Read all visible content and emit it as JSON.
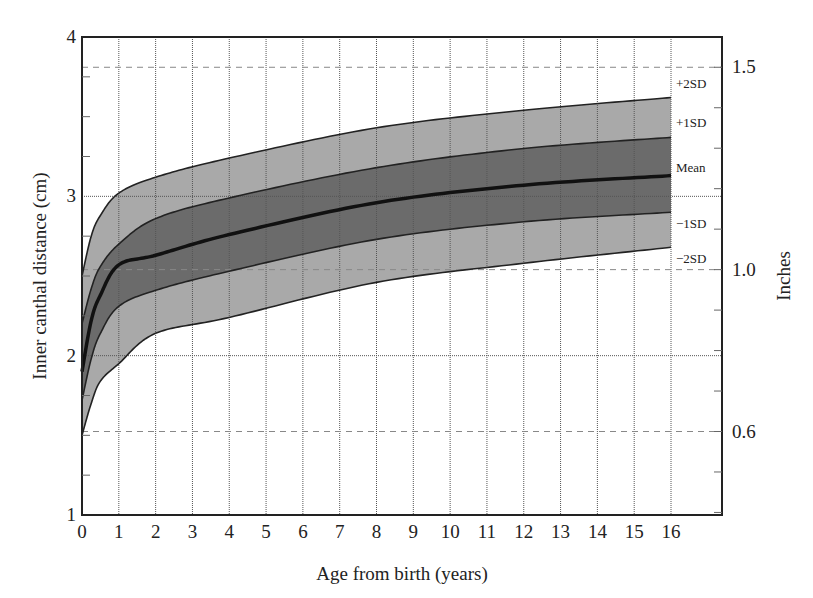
{
  "chart_data": {
    "type": "area",
    "title": "",
    "xlabel": "Age from birth (years)",
    "ylabel": "Inner canthal distance (cm)",
    "y2label": "Inches",
    "xlim": [
      0,
      17.4
    ],
    "ylim": [
      1,
      4
    ],
    "x_ticks": [
      0,
      1,
      2,
      3,
      4,
      5,
      6,
      7,
      8,
      9,
      10,
      11,
      12,
      13,
      14,
      15,
      16
    ],
    "y_ticks": [
      1,
      2,
      3,
      4
    ],
    "y2_ticks": [
      0.6,
      1.0,
      1.5
    ],
    "y2_minor_step": 0.1,
    "grid": true,
    "x": [
      0,
      0.25,
      0.5,
      1,
      2,
      4,
      8,
      12,
      16
    ],
    "series": [
      {
        "name": "+2SD",
        "values": [
          2.5,
          2.75,
          2.88,
          3.02,
          3.12,
          3.24,
          3.43,
          3.54,
          3.62
        ]
      },
      {
        "name": "+1SD",
        "values": [
          2.2,
          2.42,
          2.56,
          2.7,
          2.86,
          2.99,
          3.18,
          3.3,
          3.37
        ]
      },
      {
        "name": "Mean",
        "values": [
          1.9,
          2.22,
          2.38,
          2.57,
          2.63,
          2.76,
          2.96,
          3.07,
          3.13
        ]
      },
      {
        "name": "-1SD",
        "values": [
          1.72,
          1.98,
          2.14,
          2.31,
          2.41,
          2.53,
          2.73,
          2.84,
          2.9
        ]
      },
      {
        "name": "-2SD",
        "values": [
          1.5,
          1.7,
          1.84,
          1.95,
          2.14,
          2.24,
          2.46,
          2.58,
          2.68
        ]
      }
    ],
    "band_colors": {
      "outer": "#a9a9a9",
      "inner": "#6b6b6b",
      "mean_line": "#111111"
    },
    "legend_position": "right-inline"
  },
  "labels": {
    "xlabel": "Age from birth (years)",
    "ylabel": "Inner canthal distance (cm)",
    "y2label": "Inches",
    "sd": [
      "+2SD",
      "+1SD",
      "Mean",
      "−1SD",
      "−2SD"
    ]
  }
}
